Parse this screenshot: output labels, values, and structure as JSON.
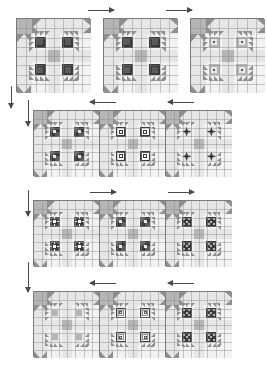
{
  "diagram": {
    "type": "quilt-layout-diagram",
    "palette": {
      "background": "#ffffff",
      "block_fill": "#f2f2f2",
      "light": "#e6e6e6",
      "medium": "#b5b5b5",
      "medium_dark": "#8f8f8f",
      "dark": "#5c5c5c",
      "very_dark": "#3a3a3a",
      "white": "#fafafa",
      "grid_line": "#8a8a8a",
      "block_border": "#7a7a7a",
      "arrow": "#4a4a4a"
    },
    "rows": [
      {
        "index": 1,
        "label": "Row 1",
        "blocks": [
          {
            "label": "Block 1-1",
            "motif": "cross-star-dark"
          },
          {
            "label": "Block 1-2",
            "motif": "cross-star-dark"
          },
          {
            "label": "Block 1-3",
            "motif": "cross-star-medium"
          }
        ],
        "arrow_direction": "right",
        "arrow_count": 2,
        "separate_blocks": true
      },
      {
        "index": 2,
        "label": "Row 2",
        "blocks": [
          {
            "label": "Block 2-1",
            "motif": "pinwheel-dark"
          },
          {
            "label": "Block 2-2",
            "motif": "square-in-square"
          },
          {
            "label": "Block 2-3",
            "motif": "star-dark"
          }
        ],
        "arrow_direction": "left",
        "arrow_count": 2,
        "separate_blocks": false
      },
      {
        "index": 3,
        "label": "Row 3",
        "blocks": [
          {
            "label": "Block 3-1",
            "motif": "flower-ring"
          },
          {
            "label": "Block 3-2",
            "motif": "pinwheel-dark"
          },
          {
            "label": "Block 3-3",
            "motif": "crosshatch-dark"
          }
        ],
        "arrow_direction": "right",
        "arrow_count": 2,
        "separate_blocks": false
      },
      {
        "index": 4,
        "label": "Row 4",
        "blocks": [
          {
            "label": "Block 4-1",
            "motif": "plain-light"
          },
          {
            "label": "Block 4-2",
            "motif": "log-cabin"
          },
          {
            "label": "Block 4-3",
            "motif": "crosshatch-dark"
          }
        ],
        "arrow_direction": "left",
        "arrow_count": 2,
        "separate_blocks": false
      }
    ],
    "side_markers": [
      {
        "label": "Row 1 direction marker",
        "direction": "down"
      },
      {
        "label": "Row 2 direction marker",
        "direction": "down"
      },
      {
        "label": "Row 3 direction marker",
        "direction": "down"
      },
      {
        "label": "Row 4 direction marker",
        "direction": "down"
      }
    ]
  }
}
